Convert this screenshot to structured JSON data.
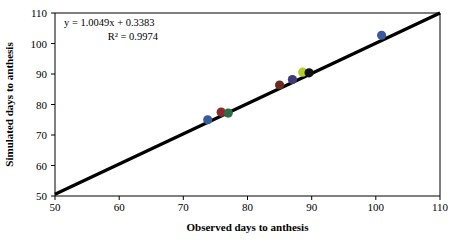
{
  "chart_data": {
    "type": "scatter",
    "title": "",
    "xlabel": "Observed days to anthesis",
    "ylabel": "Simulated days to anthesis",
    "xlim": [
      50,
      110
    ],
    "ylim": [
      50,
      110
    ],
    "xticks": [
      50,
      60,
      70,
      80,
      90,
      100,
      110
    ],
    "yticks": [
      50,
      60,
      70,
      80,
      90,
      100,
      110
    ],
    "grid": false,
    "legend": "none",
    "annotations": {
      "equation": "y = 1.0049x + 0.3383",
      "r_squared": "R² = 0.9974"
    },
    "fit_line": {
      "slope": 1.0049,
      "intercept": 0.3383,
      "r_squared": 0.9974,
      "x_start": 50,
      "x_end": 110,
      "color": "#000000"
    },
    "points": [
      {
        "x": 73.8,
        "y": 75.0,
        "color": "#3a5a9c",
        "label": "point-1"
      },
      {
        "x": 75.9,
        "y": 77.5,
        "color": "#8c2a2e",
        "label": "point-2"
      },
      {
        "x": 77.0,
        "y": 77.2,
        "color": "#2f6b44",
        "label": "point-3"
      },
      {
        "x": 85.0,
        "y": 86.4,
        "color": "#6b2a20",
        "label": "point-4"
      },
      {
        "x": 87.0,
        "y": 88.2,
        "color": "#3f3a7a",
        "label": "point-5"
      },
      {
        "x": 88.6,
        "y": 90.6,
        "color": "#b6cc2f",
        "label": "point-6"
      },
      {
        "x": 89.6,
        "y": 90.4,
        "color": "#111111",
        "label": "point-7"
      },
      {
        "x": 100.9,
        "y": 102.7,
        "color": "#3a5a9c",
        "label": "point-8"
      }
    ]
  },
  "axis": {
    "x_title": "Observed days to anthesis",
    "y_title": "Simulated days to anthesis",
    "x_tick_labels": [
      "50",
      "60",
      "70",
      "80",
      "90",
      "100",
      "110"
    ],
    "y_tick_labels": [
      "50",
      "60",
      "70",
      "80",
      "90",
      "100",
      "110"
    ]
  },
  "annotation": {
    "line1": "y = 1.0049x + 0.3383",
    "line2": "R² = 0.9974"
  },
  "colors": {
    "axis": "#000000",
    "fit_line": "#000000",
    "background": "#ffffff"
  }
}
